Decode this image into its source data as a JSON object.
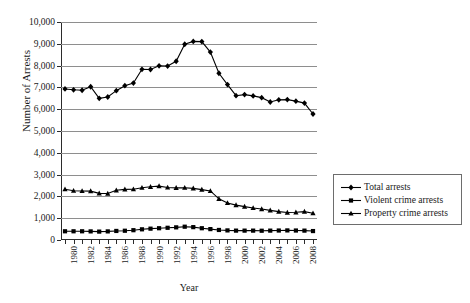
{
  "chart_data": {
    "type": "line",
    "title": "",
    "xlabel": "Year",
    "ylabel": "Number of Arrests",
    "grid": true,
    "legend_position": "right",
    "ylim": [
      0,
      10000
    ],
    "ytick_labels": [
      "10,000",
      "9,000",
      "8,000",
      "7,000",
      "6,000",
      "5,000",
      "4,000",
      "3,000",
      "2,000",
      "1,000",
      "0"
    ],
    "ytick_values": [
      10000,
      9000,
      8000,
      7000,
      6000,
      5000,
      4000,
      3000,
      2000,
      1000,
      0
    ],
    "x": [
      1980,
      1981,
      1982,
      1983,
      1984,
      1985,
      1986,
      1987,
      1988,
      1989,
      1990,
      1991,
      1992,
      1993,
      1994,
      1995,
      1996,
      1997,
      1998,
      1999,
      2000,
      2001,
      2002,
      2003,
      2004,
      2005,
      2006,
      2007,
      2008,
      2009
    ],
    "xtick_labels": [
      "1980",
      "1982",
      "1984",
      "1986",
      "1988",
      "1990",
      "1992",
      "1994",
      "1996",
      "1998",
      "2000",
      "2002",
      "2004",
      "2006",
      "2008"
    ],
    "xtick_label_step": 2,
    "series": [
      {
        "name": "Total arrests",
        "marker": "diamond",
        "color": "#000000",
        "values": [
          6930,
          6890,
          6870,
          7030,
          6500,
          6560,
          6850,
          7080,
          7200,
          7830,
          7820,
          7990,
          7980,
          8200,
          8980,
          9110,
          9100,
          8620,
          7650,
          7130,
          6620,
          6670,
          6610,
          6530,
          6330,
          6430,
          6440,
          6370,
          6280,
          5780
        ]
      },
      {
        "name": "Violent crime arrests",
        "marker": "square",
        "color": "#000000",
        "values": [
          400,
          400,
          400,
          395,
          385,
          395,
          415,
          425,
          450,
          490,
          520,
          540,
          560,
          580,
          610,
          590,
          540,
          500,
          460,
          440,
          430,
          430,
          430,
          425,
          430,
          435,
          440,
          435,
          430,
          410
        ]
      },
      {
        "name": "Property crime arrests",
        "marker": "triangle",
        "color": "#000000",
        "values": [
          2330,
          2260,
          2250,
          2240,
          2140,
          2130,
          2280,
          2320,
          2330,
          2400,
          2440,
          2470,
          2410,
          2390,
          2400,
          2370,
          2310,
          2250,
          1890,
          1700,
          1600,
          1530,
          1470,
          1420,
          1360,
          1300,
          1260,
          1270,
          1300,
          1230
        ]
      }
    ]
  },
  "legend": {
    "items": [
      {
        "label": "Total arrests",
        "marker": "diamond"
      },
      {
        "label": "Violent crime arrests",
        "marker": "square"
      },
      {
        "label": "Property crime arrests",
        "marker": "triangle"
      }
    ]
  }
}
